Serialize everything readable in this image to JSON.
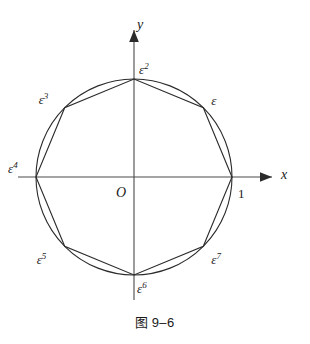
{
  "figure": {
    "caption_cjk": "图",
    "caption_number": "9–6",
    "origin_label": "O",
    "x_axis_label": "x",
    "y_axis_label": "y",
    "unit_label": "1"
  },
  "chart_data": {
    "type": "scatter",
    "xlabel": "x",
    "ylabel": "y",
    "grid": false,
    "legend": null,
    "xlim": [
      -1.35,
      1.35
    ],
    "ylim": [
      -1.25,
      1.25
    ],
    "circle": {
      "center": [
        0,
        0
      ],
      "radius": 1,
      "center_px": [
        134,
        177
      ],
      "radius_px": 98
    },
    "polygon": {
      "sides": 8,
      "inscribed": true
    },
    "points": [
      {
        "label": "1",
        "base": "1",
        "exponent": "",
        "angle_deg": 0,
        "x": 1.0,
        "y": 0.0,
        "label_dx": 6,
        "label_dy": 10
      },
      {
        "label": "ε",
        "base": "ε",
        "exponent": "",
        "angle_deg": 45,
        "x": 0.7071,
        "y": 0.7071,
        "label_dx": 8,
        "label_dy": -14
      },
      {
        "label": "ε2",
        "base": "ε",
        "exponent": "2",
        "angle_deg": 90,
        "x": 0.0,
        "y": 1.0,
        "label_dx": 5,
        "label_dy": -17
      },
      {
        "label": "ε3",
        "base": "ε",
        "exponent": "3",
        "angle_deg": 135,
        "x": -0.7071,
        "y": 0.7071,
        "label_dx": -26,
        "label_dy": -16
      },
      {
        "label": "ε4",
        "base": "ε",
        "exponent": "4",
        "angle_deg": 180,
        "x": -1.0,
        "y": 0.0,
        "label_dx": -28,
        "label_dy": -16
      },
      {
        "label": "ε5",
        "base": "ε",
        "exponent": "5",
        "angle_deg": 225,
        "x": -0.7071,
        "y": -0.7071,
        "label_dx": -28,
        "label_dy": 6
      },
      {
        "label": "ε6",
        "base": "ε",
        "exponent": "6",
        "angle_deg": 270,
        "x": 0.0,
        "y": -1.0,
        "label_dx": 3,
        "label_dy": 6
      },
      {
        "label": "ε7",
        "base": "ε",
        "exponent": "7",
        "angle_deg": 315,
        "x": 0.7071,
        "y": -0.7071,
        "label_dx": 8,
        "label_dy": 6
      }
    ]
  },
  "colors": {
    "stroke": "#2b2b2b",
    "axis": "#4a4a4a",
    "background": "#ffffff",
    "text": "#1a1a1a"
  }
}
